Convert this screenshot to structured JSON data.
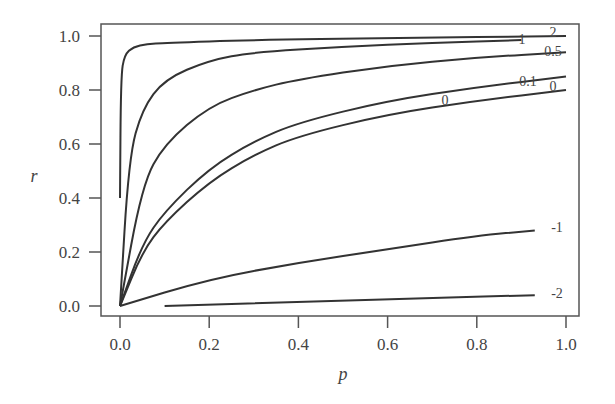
{
  "chart_data": {
    "type": "line",
    "title": "",
    "xlabel": "p",
    "ylabel": "r",
    "xlim": [
      0,
      1
    ],
    "ylim": [
      0,
      1
    ],
    "grid": false,
    "x_ticks": [
      "0.0",
      "0.2",
      "0.4",
      "0.6",
      "0.8",
      "1.0"
    ],
    "y_ticks": [
      "0.0",
      "0.2",
      "0.4",
      "0.6",
      "0.8",
      "1.0"
    ],
    "series": [
      {
        "name": "2",
        "label": "2",
        "x": [
          0.0,
          0.002,
          0.01,
          0.03,
          0.06,
          0.1,
          0.3,
          0.6,
          1.0
        ],
        "values": [
          0.4,
          0.85,
          0.93,
          0.96,
          0.97,
          0.975,
          0.985,
          0.992,
          1.0
        ]
      },
      {
        "name": "1",
        "label": "1",
        "x": [
          0.0,
          0.02,
          0.05,
          0.1,
          0.2,
          0.3,
          0.5,
          0.7,
          0.9
        ],
        "values": [
          0.0,
          0.55,
          0.73,
          0.84,
          0.91,
          0.94,
          0.96,
          0.975,
          0.985
        ]
      },
      {
        "name": "0.5",
        "label": "0.5",
        "x": [
          0.0,
          0.05,
          0.1,
          0.2,
          0.3,
          0.4,
          0.6,
          0.8,
          1.0
        ],
        "values": [
          0.0,
          0.45,
          0.6,
          0.74,
          0.8,
          0.84,
          0.89,
          0.92,
          0.94
        ]
      },
      {
        "name": "0.1",
        "label": "0.1",
        "x": [
          0.0,
          0.05,
          0.1,
          0.2,
          0.3,
          0.4,
          0.6,
          0.8,
          1.0
        ],
        "values": [
          0.0,
          0.23,
          0.35,
          0.51,
          0.61,
          0.68,
          0.76,
          0.81,
          0.85
        ]
      },
      {
        "name": "0",
        "label": "0",
        "x": [
          0.0,
          0.05,
          0.1,
          0.2,
          0.3,
          0.4,
          0.6,
          0.8,
          1.0
        ],
        "values": [
          0.0,
          0.2,
          0.31,
          0.46,
          0.56,
          0.63,
          0.71,
          0.76,
          0.8
        ]
      },
      {
        "name": "-1",
        "label": "-1",
        "x": [
          0.0,
          0.2,
          0.4,
          0.6,
          0.8,
          0.93
        ],
        "values": [
          0.0,
          0.1,
          0.16,
          0.21,
          0.26,
          0.28
        ]
      },
      {
        "name": "-2",
        "label": "-2",
        "x": [
          0.1,
          0.4,
          0.7,
          0.93
        ],
        "values": [
          0.0,
          0.015,
          0.03,
          0.04
        ]
      }
    ],
    "annotations": [
      "2",
      "1",
      "0.5",
      "0.1",
      "0",
      "0",
      "-1",
      "-2"
    ]
  }
}
